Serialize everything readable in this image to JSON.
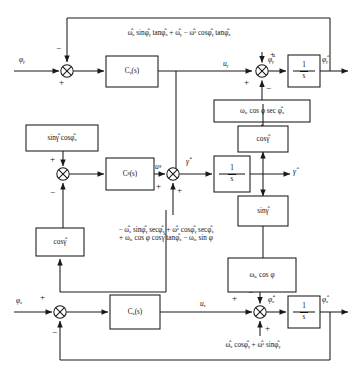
{
  "channels": {
    "top": {
      "input_label": "φᵧ",
      "controller": "Cᵧ(s)",
      "control_signal": "uᵧ",
      "state_dot": "φ̇̂ᵧ",
      "integrator": "1/s",
      "output_label": "φ̂ᵧ",
      "feedback_formula": "ω̂ₓ sinφ̂ᵧ tanφ̂ₓ + ω̂ᵧ − ω̂ᶻ cosφ̂ᵧ tanφ̂ₓ",
      "disturbance_block": "ωᵢₑ cos φ sec φ̂ₓ",
      "sum_signs": {
        "input_plus": "+",
        "feedback_minus": "−",
        "top_plus": "+",
        "left_plus": "+",
        "bottom_minus": "−"
      }
    },
    "middle": {
      "controller": "Cᵍ(s)",
      "control_signal": "uᵍ",
      "state_dot": "γ̇̂",
      "integrator": "1/s",
      "output_label": "γ̂",
      "upper_gain_block": "sinγ̂ cosφ̂ₓ",
      "lower_gain_block": "cosγ̂",
      "cos_block": "cosγ̂",
      "sin_block": "sinγ̂",
      "formula_line1": "− ω̂ₓ sinφ̂ᵧ secφ̂ₓ + ω̂ᶻ cosφ̂ᵧ secφ̂ₓ",
      "formula_line2": "+ ωᵢₑ cos φ cosγ̂ tanφ̂ₓ − ωᵢₑ sin φ",
      "sum_signs": {
        "top_plus": "+",
        "bottom_minus": "−",
        "left_plus": "+",
        "bottom_plus": "+"
      }
    },
    "bottom": {
      "input_label": "φₓ",
      "controller": "Cₓ(s)",
      "control_signal": "uₓ",
      "state_dot": "φ̇̂ₓ",
      "integrator": "1/s",
      "output_label": "φ̂ₓ",
      "gain_block": "ωᵢₑ cos φ",
      "feedback_formula": "ω̂ₓ cosφ̂ᵧ + ω̂ᶻ sinφ̂ᵧ",
      "sum_signs": {
        "input_plus": "+",
        "feedback_minus": "−",
        "left_plus": "+",
        "top_minus": "−",
        "bottom_plus": "+"
      }
    }
  },
  "colors": {
    "line": "#1a1a1a",
    "box_fill": "#ffffff",
    "text": "#111111"
  }
}
